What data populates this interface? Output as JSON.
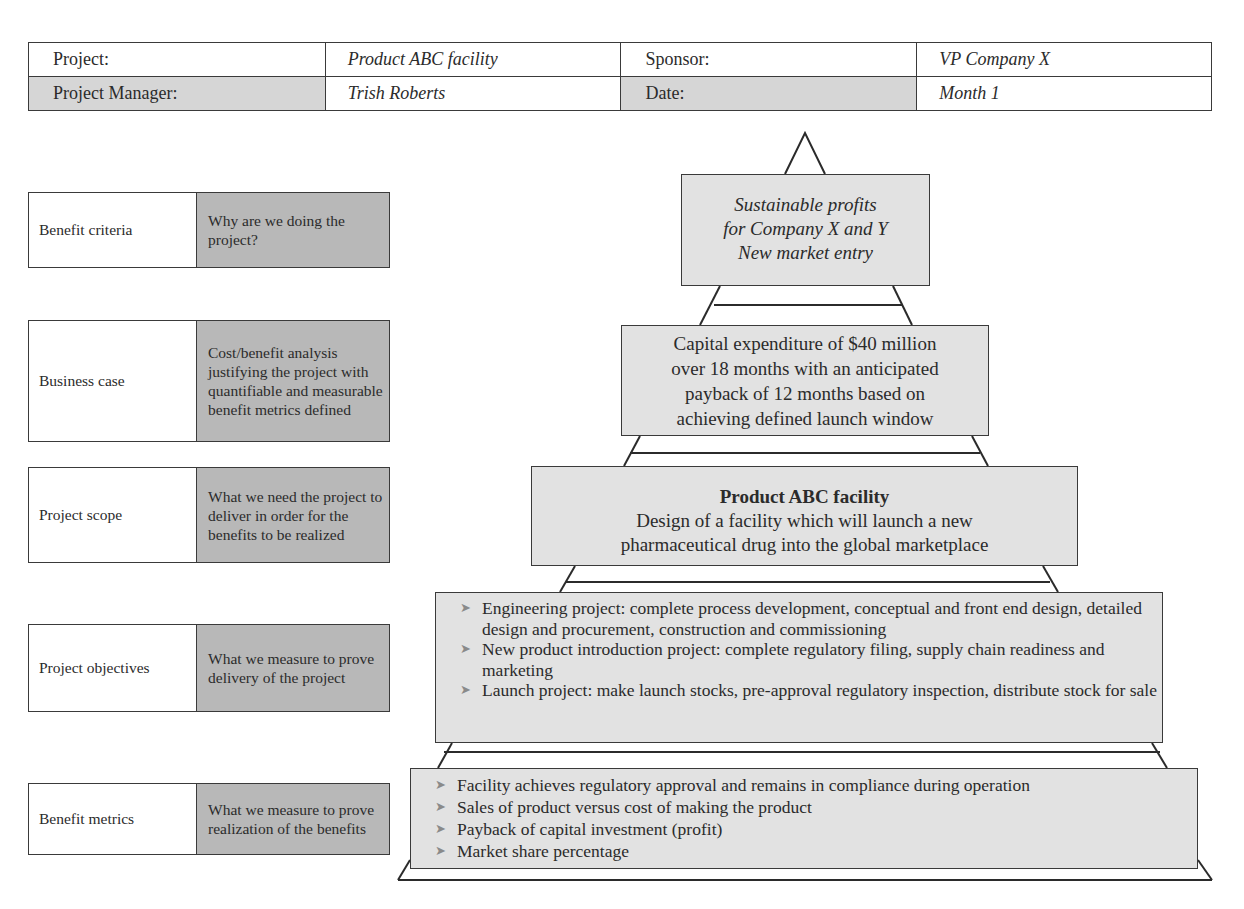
{
  "header": {
    "rows": [
      [
        {
          "label": "Project:",
          "value": "Product ABC facility"
        },
        {
          "label": "Sponsor:",
          "value": "VP Company X"
        }
      ],
      [
        {
          "label": "Project Manager:",
          "value": "Trish Roberts"
        },
        {
          "label": "Date:",
          "value": "Month 1"
        }
      ]
    ]
  },
  "criteria": [
    {
      "name": "Benefit criteria",
      "description": "Why are we doing the project?"
    },
    {
      "name": "Business case",
      "description": "Cost/benefit analysis justifying the project with quantifiable and measurable benefit metrics defined"
    },
    {
      "name": "Project scope",
      "description": "What we need the project to deliver in order for the benefits to be realized"
    },
    {
      "name": "Project objectives",
      "description": "What we measure to prove delivery of the project"
    },
    {
      "name": "Benefit metrics",
      "description": "What we measure to prove realization of the benefits"
    }
  ],
  "pyramid": {
    "benefit_criteria": {
      "lines": [
        "Sustainable profits",
        "for Company X and Y",
        "New market entry"
      ]
    },
    "business_case": {
      "lines": [
        "Capital expenditure of $40 million",
        "over 18 months with an anticipated",
        "payback of 12 months based on",
        "achieving defined launch window"
      ]
    },
    "project_scope": {
      "title": "Product ABC facility",
      "lines": [
        "Design of a facility which will launch a new",
        "pharmaceutical drug into the global marketplace"
      ]
    },
    "project_objectives": {
      "bullet_icon": "arrow-bullet",
      "items": [
        "Engineering project: complete process development, conceptual and front end design, detailed design and procurement, construction and commissioning",
        "New product introduction project: complete regulatory filing, supply chain readiness and marketing",
        "Launch project: make launch stocks, pre-approval regulatory inspection, distribute stock for sale"
      ]
    },
    "benefit_metrics": {
      "bullet_icon": "arrow-bullet",
      "items": [
        "Facility achieves regulatory approval and remains in compliance during operation",
        "Sales of product versus cost of making the product",
        "Payback of capital investment (profit)",
        "Market share percentage"
      ]
    }
  },
  "colors": {
    "border": "#3a3a3a",
    "tier_fill": "#e2e2e2",
    "criteria_desc_fill": "#b8b8b8",
    "header_label_fill": "#d6d6d6"
  }
}
